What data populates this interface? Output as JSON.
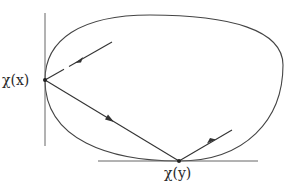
{
  "diagram": {
    "type": "geometric-figure",
    "colors": {
      "stroke": "#333333",
      "tangent": "#666666",
      "background": "#ffffff"
    },
    "labels": {
      "point_x": "χ(x)",
      "point_y": "χ(y)"
    },
    "points": {
      "chi_x": {
        "x": 45,
        "y": 80
      },
      "chi_y": {
        "x": 179,
        "y": 161
      }
    },
    "segments": [
      {
        "name": "incoming-ray",
        "from": [
          112,
          42
        ],
        "to": [
          45,
          80
        ],
        "arrow": "toward chi_x"
      },
      {
        "name": "chord",
        "from": [
          45,
          80
        ],
        "to": [
          179,
          161
        ],
        "arrow": "toward chi_y"
      },
      {
        "name": "outgoing-ray",
        "from": [
          179,
          161
        ],
        "to": [
          232,
          130
        ],
        "arrow": "away from chi_y"
      }
    ],
    "tangents": [
      {
        "name": "vertical-tangent",
        "at": "chi_x",
        "from": [
          45,
          13
        ],
        "to": [
          45,
          146
        ]
      },
      {
        "name": "horizontal-tangent",
        "at": "chi_y",
        "from": [
          98,
          161
        ],
        "to": [
          258,
          161
        ]
      }
    ]
  }
}
